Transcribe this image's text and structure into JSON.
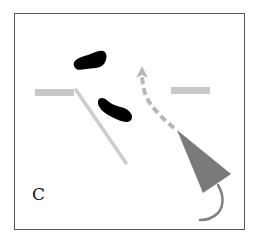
{
  "panel": {
    "label": "C"
  },
  "colors": {
    "frame": "#555555",
    "blob": "#000000",
    "light_gray": "#c8c8c8",
    "arrow_gray": "#b8b8b8",
    "cone_gray": "#7a7a7a",
    "tail_gray": "#808080",
    "background": "#ffffff"
  },
  "shapes": {
    "blob_upper": "black-blob",
    "blob_lower": "black-blob",
    "bar_left": "gray-bar",
    "bar_right": "gray-bar",
    "diagonal_line": "gray-line",
    "dashed_arrow": "curved-dashed-arrow",
    "cone": "gray-triangle-cone",
    "tail": "curved-tail-line"
  }
}
